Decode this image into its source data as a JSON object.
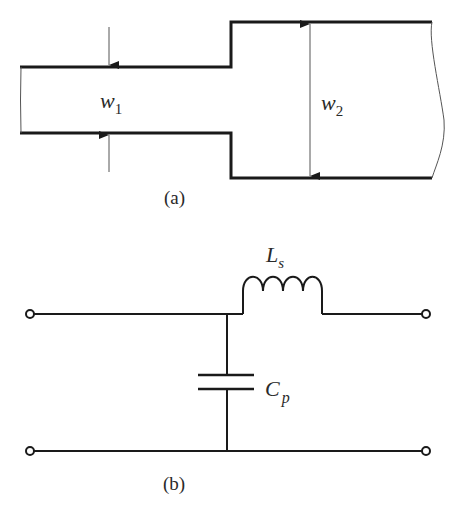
{
  "figure": {
    "part_a": {
      "caption": "(a)",
      "description": "Microstrip width step discontinuity",
      "labels": {
        "narrow_width": {
          "main": "w",
          "sub": "1"
        },
        "wide_width": {
          "main": "w",
          "sub": "2"
        }
      }
    },
    "part_b": {
      "caption": "(b)",
      "description": "Equivalent circuit: shunt capacitor followed by series inductor",
      "labels": {
        "inductor": {
          "main": "L",
          "sub": "s"
        },
        "capacitor": {
          "main": "C",
          "sub": "p"
        }
      }
    },
    "colors": {
      "stroke": "#1a1a1a",
      "thin_stroke": "#555555",
      "background": "#ffffff"
    }
  }
}
